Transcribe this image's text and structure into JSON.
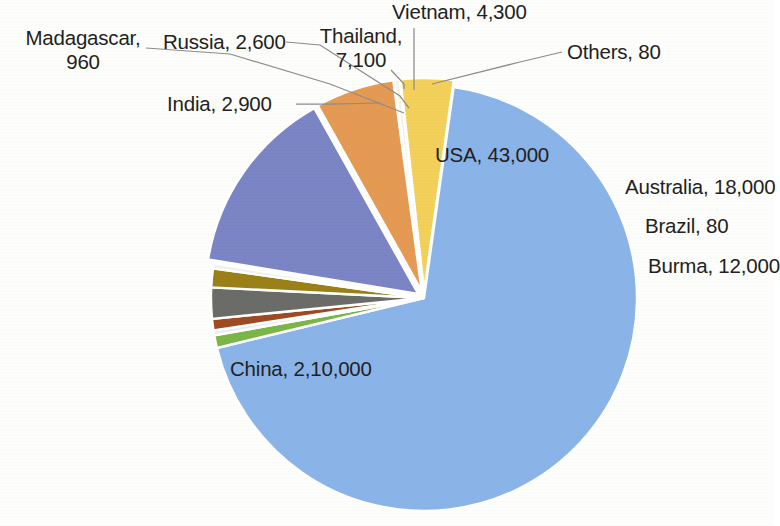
{
  "chart_data": {
    "type": "pie",
    "title": "",
    "subtitle": "",
    "xlabel": "",
    "ylabel": "",
    "legend_position": "none",
    "grid": false,
    "label_format": "name, value",
    "categories": [
      "China",
      "India",
      "Madagascar",
      "Russia",
      "Thailand",
      "Vietnam",
      "Others",
      "USA",
      "Australia",
      "Brazil",
      "Burma"
    ],
    "values": [
      210000,
      2900,
      960,
      2600,
      7100,
      4300,
      80,
      43000,
      18000,
      80,
      12000
    ],
    "value_labels": [
      "2,10,000",
      "2,900",
      "960",
      "2,600",
      "7,100",
      "4,300",
      "80",
      "43,000",
      "18,000",
      "80",
      "12,000"
    ],
    "colors": [
      "#8ab4e8",
      "#7ab648",
      "#e9eef5",
      "#9e4a22",
      "#6b6b68",
      "#9a8017",
      "#f0f0ee",
      "#7b84c4",
      "#e59a54",
      "#f7f2e2",
      "#f2d05a"
    ],
    "slices": [
      {
        "name": "China",
        "value": 210000,
        "value_label": "2,10,000",
        "label": "China, 2,10,000",
        "color": "#8ab4e8",
        "exploded": false
      },
      {
        "name": "India",
        "value": 2900,
        "value_label": "2,900",
        "label": "India, 2,900",
        "color": "#7ab648",
        "exploded": false
      },
      {
        "name": "Madagascar",
        "value": 960,
        "value_label": "960",
        "label": "Madagascar, 960",
        "color": "#e9eef5",
        "exploded": false
      },
      {
        "name": "Russia",
        "value": 2600,
        "value_label": "2,600",
        "label": "Russia, 2,600",
        "color": "#9e4a22",
        "exploded": false
      },
      {
        "name": "Thailand",
        "value": 7100,
        "value_label": "7,100",
        "label": "Thailand, 7,100",
        "color": "#6b6b68",
        "exploded": false
      },
      {
        "name": "Vietnam",
        "value": 4300,
        "value_label": "4,300",
        "label": "Vietnam, 4,300",
        "color": "#9a8017",
        "exploded": false
      },
      {
        "name": "Others",
        "value": 80,
        "value_label": "80",
        "label": "Others, 80",
        "color": "#f0f0ee",
        "exploded": false
      },
      {
        "name": "USA",
        "value": 43000,
        "value_label": "43,000",
        "label": "USA, 43,000",
        "color": "#7b84c4",
        "exploded": true
      },
      {
        "name": "Australia",
        "value": 18000,
        "value_label": "18,000",
        "label": "Australia, 18,000",
        "color": "#e59a54",
        "exploded": true
      },
      {
        "name": "Brazil",
        "value": 80,
        "value_label": "80",
        "label": "Brazil, 80",
        "color": "#f7f2e2",
        "exploded": true
      },
      {
        "name": "Burma",
        "value": 12000,
        "value_label": "12,000",
        "label": "Burma, 12,000",
        "color": "#f2d05a",
        "exploded": true
      }
    ]
  },
  "labels": {
    "madagascar_line1": "Madagascar,",
    "madagascar_line2": "960",
    "russia": "Russia, 2,600",
    "india": "India, 2,900",
    "thailand_line1": "Thailand,",
    "thailand_line2": "7,100",
    "vietnam": "Vietnam, 4,300",
    "others": "Others, 80",
    "usa": "USA, 43,000",
    "australia": "Australia, 18,000",
    "brazil": "Brazil, 80",
    "burma": "Burma, 12,000",
    "china": "China, 2,10,000"
  }
}
